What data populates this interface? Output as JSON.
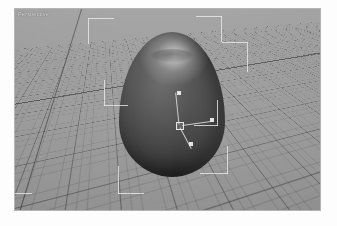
{
  "app": {
    "kind": "3d-modeling-viewport",
    "background": "#ffffff"
  },
  "viewport": {
    "label": "Perspective",
    "label_color": "#f2f2f2",
    "background_color": "#9a9a9a",
    "border_color": "#b4b4b4",
    "grid": {
      "visible": true,
      "minor_line_color": "#5a5a5a",
      "major_line_color": "#3c3c3c",
      "axis_line_color": "#4c4c4c",
      "axes_visible": true
    }
  },
  "object": {
    "name": "egg",
    "shape": "ovoid",
    "shading": "smooth-shaded",
    "base_color": "#4a4a4a",
    "highlight_color": "#d7d7d7",
    "shadow_color": "#262626",
    "selected": true
  },
  "selection": {
    "bounding_box_visible": true,
    "bracket_color": "#e8e8e8",
    "brackets": [
      {
        "name": "corner-back-left-top",
        "x": 88,
        "y": 18,
        "w": 26,
        "h": 26,
        "orient": "tl"
      },
      {
        "name": "corner-back-right-top",
        "x": 196,
        "y": 16,
        "w": 26,
        "h": 26,
        "orient": "tr"
      },
      {
        "name": "corner-front-right-top",
        "x": 222,
        "y": 42,
        "w": 26,
        "h": 30,
        "orient": "tr"
      },
      {
        "name": "corner-left-mid",
        "x": 104,
        "y": 80,
        "w": 24,
        "h": 26,
        "orient": "bl"
      },
      {
        "name": "corner-right-mid",
        "x": 194,
        "y": 100,
        "w": 24,
        "h": 26,
        "orient": "br"
      },
      {
        "name": "corner-front-right-bot",
        "x": 200,
        "y": 146,
        "w": 28,
        "h": 28,
        "orient": "br"
      },
      {
        "name": "corner-front-mid-bot",
        "x": 118,
        "y": 166,
        "w": 26,
        "h": 28,
        "orient": "bl"
      },
      {
        "name": "corner-front-left-bot",
        "x": 14,
        "y": 172,
        "w": 18,
        "h": 22,
        "orient": "bl"
      }
    ]
  },
  "gizmo": {
    "name": "translate-gizmo",
    "type": "move",
    "color": "#d8d8d8",
    "origin_handle": "square",
    "axes": [
      {
        "name": "axis-y-up",
        "label": "Y",
        "direction": "up"
      },
      {
        "name": "axis-x-right",
        "label": "X",
        "direction": "right-down"
      },
      {
        "name": "axis-z-down-left",
        "label": "Z",
        "direction": "down-left"
      }
    ]
  }
}
